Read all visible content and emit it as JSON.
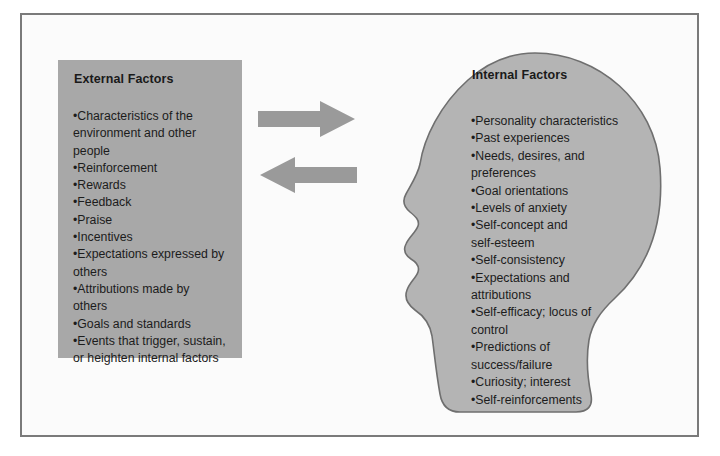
{
  "diagram": {
    "title_external": "External Factors",
    "title_internal": "Internal Factors",
    "colors": {
      "box_fill": "#a8a8a8",
      "head_fill": "#b4b4b4",
      "head_stroke": "#6f6f6f",
      "arrow_fill": "#9a9a9a",
      "frame_stroke": "#7a7a7a",
      "page_bg": "#fbfbfb",
      "text": "#1c1c1c"
    },
    "external_factors": [
      "•Characteristics of the",
      "environment and other",
      "people",
      "•Reinforcement",
      "•Rewards",
      "•Feedback",
      "•Praise",
      "•Incentives",
      "•Expectations expressed by",
      "others",
      "•Attributions made by",
      "others",
      "•Goals and standards",
      "•Events that trigger, sustain,",
      "or heighten internal factors"
    ],
    "internal_factors": [
      "•Personality characteristics",
      "•Past experiences",
      "•Needs, desires, and",
      "preferences",
      "•Goal orientations",
      "•Levels of anxiety",
      "•Self-concept and",
      "self-esteem",
      "•Self-consistency",
      "•Expectations and",
      "attributions",
      "•Self-efficacy; locus of",
      "control",
      "•Predictions of",
      "success/failure",
      "•Curiosity; interest",
      "•Self-reinforcements"
    ],
    "arrows": [
      {
        "name": "arrow-external-to-internal",
        "direction": "right"
      },
      {
        "name": "arrow-internal-to-external",
        "direction": "left"
      }
    ]
  }
}
